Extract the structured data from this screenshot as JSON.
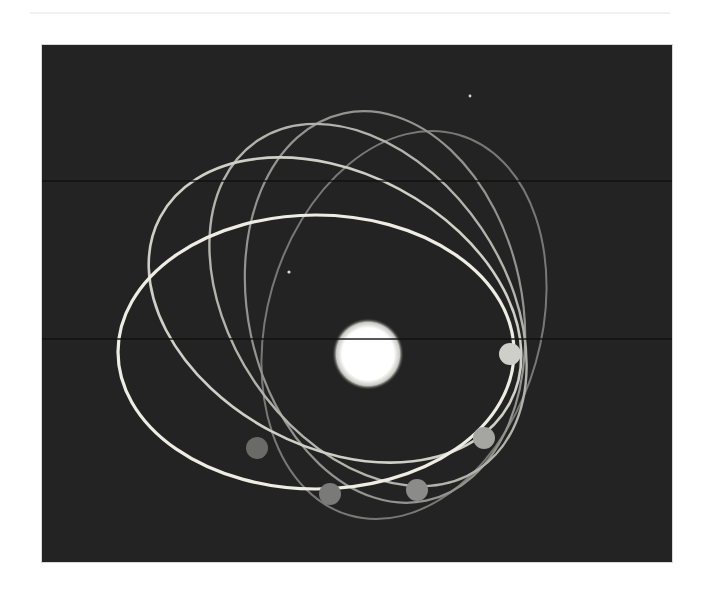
{
  "figure": {
    "background_color": "#232323",
    "page_color": "#ffffff",
    "panel": {
      "x": 42,
      "y": 45,
      "width": 630,
      "height": 517
    }
  },
  "star": {
    "name": "central-star",
    "cx": 326,
    "cy": 309,
    "r": 30,
    "color": "#ffffff"
  },
  "orbits": [
    {
      "name": "orbit-1",
      "cx": 274,
      "cy": 307,
      "rx": 198,
      "ry": 137,
      "rotate": 0,
      "stroke": "#eeede5",
      "width": 3.2
    },
    {
      "name": "orbit-2",
      "cx": 293,
      "cy": 265,
      "rx": 198,
      "ry": 137,
      "rotate": 28,
      "stroke": "#cfcfc8",
      "width": 2.6
    },
    {
      "name": "orbit-3",
      "cx": 326,
      "cy": 260,
      "rx": 198,
      "ry": 137,
      "rotate": 56,
      "stroke": "#b3b3ad",
      "width": 2.4
    },
    {
      "name": "orbit-4",
      "cx": 343,
      "cy": 262,
      "rx": 198,
      "ry": 137,
      "rotate": 78,
      "stroke": "#939390",
      "width": 2.2
    },
    {
      "name": "orbit-5",
      "cx": 362,
      "cy": 280,
      "rx": 198,
      "ry": 137,
      "rotate": 106,
      "stroke": "#787876",
      "width": 2.0
    }
  ],
  "planets": [
    {
      "name": "planet-1",
      "cx": 468,
      "cy": 309,
      "r": 11,
      "color": "#cfcfc9"
    },
    {
      "name": "planet-2",
      "cx": 442,
      "cy": 393,
      "r": 11,
      "color": "#a5a5a2"
    },
    {
      "name": "planet-3",
      "cx": 375,
      "cy": 445,
      "r": 11,
      "color": "#8b8b89"
    },
    {
      "name": "planet-4",
      "cx": 288,
      "cy": 449,
      "r": 11,
      "color": "#7a7a78"
    },
    {
      "name": "planet-5",
      "cx": 215,
      "cy": 403,
      "r": 11,
      "color": "#6a6a68"
    }
  ],
  "specks": [
    {
      "cx": 247,
      "cy": 227,
      "r": 1.6
    },
    {
      "cx": 428,
      "cy": 51,
      "r": 1.4
    }
  ],
  "scanlines": [
    135,
    293
  ]
}
